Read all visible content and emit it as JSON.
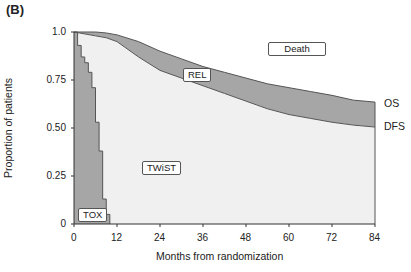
{
  "panel_label": "(B)",
  "chart_data": {
    "type": "area",
    "title": "",
    "xlabel": "Months from randomization",
    "ylabel": "Proportion of patients",
    "xlim": [
      0,
      84
    ],
    "ylim": [
      0,
      1.0
    ],
    "xticks": [
      "0",
      "12",
      "24",
      "36",
      "48",
      "60",
      "72",
      "84"
    ],
    "yticks": [
      "0",
      "0.25",
      "0.50",
      "0.75",
      "1.0"
    ],
    "grid": false,
    "series": [
      {
        "name": "OS",
        "x": [
          0,
          6,
          9,
          12,
          18,
          24,
          30,
          36,
          42,
          48,
          54,
          60,
          66,
          72,
          78,
          84
        ],
        "values": [
          1.0,
          1.0,
          0.995,
          0.985,
          0.95,
          0.9,
          0.86,
          0.82,
          0.79,
          0.76,
          0.73,
          0.71,
          0.69,
          0.67,
          0.645,
          0.635
        ]
      },
      {
        "name": "DFS",
        "x": [
          0,
          6,
          9,
          12,
          18,
          24,
          30,
          36,
          42,
          48,
          54,
          60,
          66,
          72,
          78,
          84
        ],
        "values": [
          1.0,
          0.98,
          0.97,
          0.95,
          0.87,
          0.8,
          0.76,
          0.72,
          0.68,
          0.64,
          0.6,
          0.57,
          0.55,
          0.53,
          0.515,
          0.505
        ]
      },
      {
        "name": "TOX",
        "x": [
          0,
          1,
          2,
          3,
          4,
          5,
          6,
          7,
          8,
          9,
          10
        ],
        "values": [
          1.0,
          0.93,
          0.87,
          0.84,
          0.79,
          0.71,
          0.53,
          0.38,
          0.13,
          0.05,
          0.0
        ]
      }
    ],
    "region_labels": [
      "TOX",
      "TWiST",
      "REL",
      "Death"
    ],
    "end_labels": [
      "OS",
      "DFS"
    ]
  }
}
